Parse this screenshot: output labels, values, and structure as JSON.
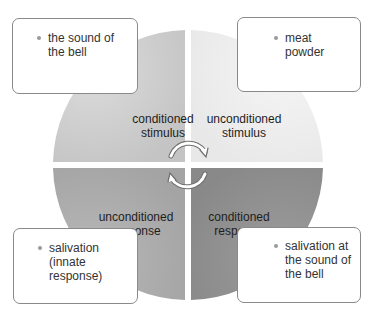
{
  "diagram": {
    "center": {
      "x": 188,
      "y": 165
    },
    "radius": 135,
    "gap": 6,
    "quadrants": [
      {
        "id": "top-left",
        "label_line1": "conditioned",
        "label_line2": "stimulus",
        "fill": "#c9c9c9",
        "fill_light": "#dadada"
      },
      {
        "id": "top-right",
        "label_line1": "unconditioned",
        "label_line2": "stimulus",
        "fill": "#ebebeb",
        "fill_light": "#f4f4f4"
      },
      {
        "id": "bottom-left",
        "label_line1": "unconditioned",
        "label_line2": "response",
        "fill": "#a8a8a8",
        "fill_light": "#b7b7b7"
      },
      {
        "id": "bottom-right",
        "label_line1": "conditioned",
        "label_line2": "response",
        "fill": "#8d8d8d",
        "fill_light": "#9b9b9b"
      }
    ],
    "callouts": [
      {
        "id": "top-left",
        "lines": [
          "the sound of",
          "the bell"
        ]
      },
      {
        "id": "top-right",
        "lines": [
          "meat",
          "powder"
        ]
      },
      {
        "id": "bottom-left",
        "lines": [
          "salivation",
          "(innate",
          "response)"
        ]
      },
      {
        "id": "bottom-right",
        "lines": [
          "salivation at",
          "the sound of",
          "the bell"
        ]
      }
    ],
    "cycle_arrows": {
      "color": "#ffffff",
      "outline": "#7a7a7a"
    }
  }
}
